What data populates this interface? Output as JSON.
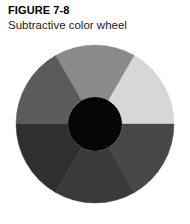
{
  "caption": {
    "figure_number": "FIGURE 7-8",
    "title": "Subtractive color wheel"
  },
  "chart_data": {
    "type": "pie",
    "title": "Subtractive color wheel",
    "subtitle": "FIGURE 7-8",
    "xlabel": "",
    "ylabel": "",
    "legend_position": "none",
    "grid": false,
    "donut": true,
    "center": {
      "cx": 95,
      "cy": 124
    },
    "outer_radius": 79,
    "inner_radius": 27,
    "hub_color": "#050505",
    "note": "Grayscale halftone reproduction of a six-segment subtractive color wheel; each wedge is an equal 60-degree slice.",
    "categories": [
      "segment-top",
      "segment-upper-right",
      "segment-lower-right",
      "segment-bottom",
      "segment-lower-left",
      "segment-upper-left"
    ],
    "values": [
      60,
      60,
      60,
      60,
      60,
      60
    ],
    "colors": [
      "#8a8a8a",
      "#d7d7d7",
      "#474747",
      "#3a3a3a",
      "#2f2f2f",
      "#5b5b5b"
    ],
    "start_angles": [
      -30,
      30,
      90,
      150,
      210,
      270
    ],
    "end_angles": [
      30,
      90,
      150,
      210,
      270,
      330
    ]
  }
}
